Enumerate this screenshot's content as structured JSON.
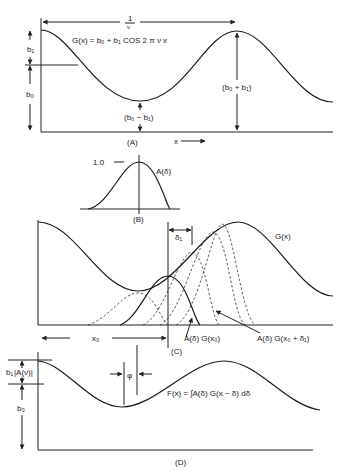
{
  "panels": {
    "A": {
      "label": "(A)",
      "period_label_num": "1",
      "period_label_den": "ν",
      "equation": "G(x) = b₀ + b₁ COS 2 π ν x",
      "b1_label": "b₁",
      "b0_label": "b₀",
      "min_label": "(b₀ − b₁)",
      "max_label": "(b₀ + b₁)",
      "x_axis_label": "x"
    },
    "B": {
      "label": "(B)",
      "peak_value": "1.0",
      "curve_label": "A(δ)"
    },
    "C": {
      "label": "(C)",
      "curve_label": "G(x)",
      "delta_label": "δ₁",
      "x0_label": "x₀",
      "annot1": "A(δ) G(x₀)",
      "annot2": "A(δ) G(x₀ + δ₁)"
    },
    "D": {
      "label": "(D)",
      "b1A_label": "b₁",
      "A_label": "|A(ν)|",
      "b0_label": "b₀",
      "phase_label": "φ",
      "equation": "F(x) = ∫A(δ) G(x − δ) dδ"
    }
  },
  "colors": {
    "ink": "#222222",
    "background": "#ffffff"
  }
}
